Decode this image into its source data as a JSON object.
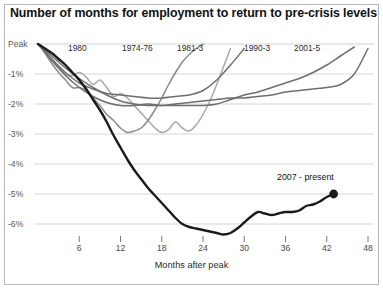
{
  "chart": {
    "title": "Number of months for employment to return to pre-crisis levels",
    "xlabel": "Months after peak",
    "ylabel": ""
  },
  "axis": {
    "y_ticks": [
      "Peak",
      "-1%",
      "-2%",
      "-3%",
      "-4%",
      "-5%",
      "-6%"
    ],
    "x_ticks": [
      "6",
      "12",
      "18",
      "24",
      "30",
      "36",
      "42",
      "48"
    ]
  },
  "annotations": {
    "current": "2007 - present"
  },
  "series_labels": {
    "s1980": "1980",
    "s1974": "1974-76",
    "s1981": "1981-3",
    "s1990": "1990-3",
    "s2001": "2001-5"
  },
  "colors": {
    "current": "#1a1a1a",
    "recession_light": "#a8a8a8",
    "recession_mid": "#8a8a8a",
    "recession_dark": "#6e6e6e",
    "grid": "#d2d2d2",
    "frame": "#b9b9b9"
  },
  "chart_data": {
    "type": "line",
    "title": "Number of months for employment to return to pre-crisis levels",
    "xlabel": "Months after peak",
    "ylabel": "Percent below peak employment",
    "xlim": [
      0,
      48
    ],
    "ylim": [
      -6.6,
      0.2
    ],
    "xticks": [
      6,
      12,
      18,
      24,
      30,
      36,
      42,
      48
    ],
    "yticks": [
      0,
      -1,
      -2,
      -3,
      -4,
      -5,
      -6
    ],
    "ytick_labels": [
      "Peak",
      "-1%",
      "-2%",
      "-3%",
      "-4%",
      "-5%",
      "-6%"
    ],
    "grid": "horizontal",
    "legend": "inline-labels",
    "series": [
      {
        "name": "1980",
        "color": "#a8a8a8",
        "x": [
          0,
          1,
          2,
          3,
          4,
          5,
          6,
          7,
          8,
          9,
          10,
          11,
          12,
          13,
          14,
          15,
          16,
          17,
          18,
          19,
          20,
          21,
          22,
          23,
          24,
          25,
          26,
          27,
          28
        ],
        "y": [
          0,
          -0.25,
          -0.5,
          -0.75,
          -1.0,
          -1.05,
          -0.95,
          -1.1,
          -1.35,
          -1.2,
          -1.45,
          -1.75,
          -1.65,
          -1.8,
          -2.05,
          -2.3,
          -2.55,
          -2.8,
          -2.95,
          -2.85,
          -2.6,
          -2.8,
          -2.9,
          -2.7,
          -2.35,
          -1.9,
          -1.35,
          -0.75,
          -0.15
        ]
      },
      {
        "name": "1974-76",
        "color": "#8a8a8a",
        "x": [
          0,
          1,
          2,
          3,
          4,
          5,
          6,
          7,
          8,
          9,
          10,
          11,
          12,
          13,
          14,
          15,
          16,
          17,
          18,
          19,
          20,
          21,
          22,
          23,
          24
        ],
        "y": [
          0,
          -0.3,
          -0.65,
          -0.95,
          -1.2,
          -1.45,
          -1.45,
          -1.55,
          -1.8,
          -2.05,
          -2.35,
          -2.55,
          -2.8,
          -2.95,
          -2.9,
          -2.8,
          -2.55,
          -2.2,
          -1.8,
          -1.35,
          -0.95,
          -0.6,
          -0.35,
          -0.15,
          0.0
        ]
      },
      {
        "name": "1981-3",
        "color": "#6e6e6e",
        "x": [
          0,
          2,
          4,
          6,
          8,
          10,
          12,
          14,
          16,
          18,
          20,
          22,
          24,
          26,
          28,
          30,
          32,
          34,
          36,
          38,
          40,
          42,
          44,
          46,
          48
        ],
        "y": [
          0,
          -0.55,
          -1.05,
          -1.45,
          -1.75,
          -1.95,
          -2.05,
          -2.05,
          -2.0,
          -2.05,
          -2.0,
          -1.95,
          -1.9,
          -1.85,
          -1.8,
          -1.8,
          -1.75,
          -1.7,
          -1.6,
          -1.55,
          -1.5,
          -1.45,
          -1.35,
          -1.0,
          -0.15
        ]
      },
      {
        "name": "1990-3",
        "color": "#6e6e6e",
        "x": [
          0,
          2,
          4,
          6,
          8,
          10,
          12,
          14,
          16,
          18,
          20,
          22,
          24,
          26,
          28,
          30
        ],
        "y": [
          0,
          -0.5,
          -0.95,
          -1.3,
          -1.5,
          -1.65,
          -1.7,
          -1.75,
          -1.8,
          -1.8,
          -1.75,
          -1.7,
          -1.55,
          -1.2,
          -0.7,
          -0.15
        ]
      },
      {
        "name": "2001-5",
        "color": "#6e6e6e",
        "x": [
          0,
          2,
          4,
          6,
          8,
          10,
          12,
          14,
          16,
          18,
          20,
          22,
          24,
          26,
          28,
          30,
          32,
          34,
          36,
          38,
          40,
          42,
          44,
          46
        ],
        "y": [
          0,
          -0.4,
          -0.8,
          -1.15,
          -1.45,
          -1.7,
          -1.9,
          -2.0,
          -2.05,
          -2.05,
          -2.05,
          -2.05,
          -2.05,
          -2.0,
          -1.85,
          -1.7,
          -1.6,
          -1.45,
          -1.3,
          -1.15,
          -0.95,
          -0.7,
          -0.4,
          -0.1
        ]
      },
      {
        "name": "2007 - present",
        "color": "#1a1a1a",
        "highlight": true,
        "end_marker": true,
        "x": [
          0,
          1,
          2,
          3,
          4,
          5,
          6,
          7,
          8,
          9,
          10,
          11,
          12,
          13,
          14,
          15,
          16,
          17,
          18,
          19,
          20,
          21,
          22,
          23,
          24,
          25,
          26,
          27,
          28,
          29,
          30,
          31,
          32,
          33,
          34,
          35,
          36,
          37,
          38,
          39,
          40,
          41,
          42,
          43
        ],
        "y": [
          0,
          -0.15,
          -0.3,
          -0.5,
          -0.7,
          -0.95,
          -1.2,
          -1.5,
          -1.85,
          -2.2,
          -2.6,
          -3.05,
          -3.45,
          -3.85,
          -4.2,
          -4.5,
          -4.8,
          -5.05,
          -5.3,
          -5.55,
          -5.8,
          -6.0,
          -6.1,
          -6.15,
          -6.2,
          -6.25,
          -6.3,
          -6.35,
          -6.3,
          -6.15,
          -5.95,
          -5.75,
          -5.6,
          -5.65,
          -5.7,
          -5.65,
          -5.6,
          -5.6,
          -5.55,
          -5.4,
          -5.35,
          -5.25,
          -5.1,
          -5.0
        ]
      }
    ]
  }
}
